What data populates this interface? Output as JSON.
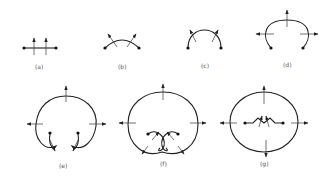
{
  "figure": {
    "panels": [
      {
        "id": "a",
        "label": "(a)",
        "description": "straight segment with two endpoint dots and two upward arrows crossing it"
      },
      {
        "id": "b",
        "label": "(b)",
        "description": "slightly curved arc with endpoint dots and two outward-tilted arrows"
      },
      {
        "id": "c",
        "label": "(c)",
        "description": "semicircular arc with endpoint dots and two outward arrows"
      },
      {
        "id": "d",
        "label": "(d)",
        "description": "open arc bending down with arrows pointing up, left and right"
      },
      {
        "id": "e",
        "label": "(e)",
        "description": "nearly closed loop with curled-in ends and arrows up, left, right"
      },
      {
        "id": "f",
        "label": "(f)",
        "description": "closed loop with crossing inner curls and arrows in four directions"
      },
      {
        "id": "g",
        "label": "(g)",
        "description": "closed oval with a small inner zigzag segment between two dots and arrows in four directions"
      }
    ]
  }
}
